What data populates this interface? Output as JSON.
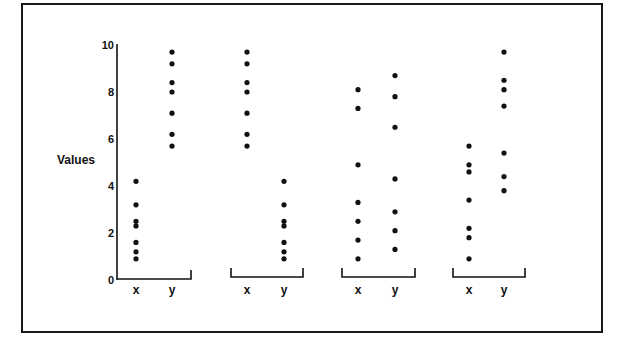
{
  "chart_data": {
    "type": "scatter",
    "title": "",
    "xlabel": "",
    "ylabel": "Values",
    "ylim": [
      0,
      10
    ],
    "yticks": [
      0,
      2,
      4,
      6,
      8,
      10
    ],
    "grid": false,
    "legend": null,
    "groups": [
      {
        "name": "Set 1",
        "categories": [
          "x",
          "y"
        ],
        "series": [
          {
            "name": "x",
            "values": [
              4.2,
              3.2,
              2.5,
              2.3,
              1.6,
              1.2,
              0.9
            ]
          },
          {
            "name": "y",
            "values": [
              9.7,
              9.2,
              8.4,
              8.0,
              7.1,
              6.2,
              5.7
            ]
          }
        ]
      },
      {
        "name": "Set 2",
        "categories": [
          "x",
          "y"
        ],
        "series": [
          {
            "name": "x",
            "values": [
              9.7,
              9.2,
              8.4,
              8.0,
              7.1,
              6.2,
              5.7
            ]
          },
          {
            "name": "y",
            "values": [
              4.2,
              3.2,
              2.5,
              2.3,
              1.6,
              1.2,
              0.9
            ]
          }
        ]
      },
      {
        "name": "Set 3",
        "categories": [
          "x",
          "y"
        ],
        "series": [
          {
            "name": "x",
            "values": [
              8.1,
              7.3,
              4.9,
              3.3,
              2.5,
              1.7,
              0.9
            ]
          },
          {
            "name": "y",
            "values": [
              8.7,
              7.8,
              6.5,
              4.3,
              2.9,
              2.1,
              1.3
            ]
          }
        ]
      },
      {
        "name": "Set 4",
        "categories": [
          "x",
          "y"
        ],
        "series": [
          {
            "name": "x",
            "values": [
              5.7,
              4.9,
              4.6,
              3.4,
              2.2,
              1.8,
              0.9
            ]
          },
          {
            "name": "y",
            "values": [
              9.7,
              8.5,
              8.1,
              7.4,
              5.4,
              4.4,
              3.8
            ]
          }
        ]
      }
    ]
  },
  "labels": {
    "ylabel": "Values",
    "yticks": [
      "0",
      "2",
      "4",
      "6",
      "8",
      "10"
    ],
    "x_cat": "x",
    "y_cat": "y"
  },
  "colors": {
    "ink": "#111111",
    "frame": "#1a1a1a",
    "background": "#ffffff"
  }
}
